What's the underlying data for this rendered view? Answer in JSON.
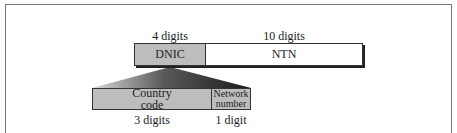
{
  "diagram": {
    "top_row": {
      "fields": [
        {
          "name": "DNIC",
          "size_label": "4 digits"
        },
        {
          "name": "NTN",
          "size_label": "10 digits"
        }
      ]
    },
    "dnic_breakdown": {
      "fields": [
        {
          "name": "Country code",
          "name_lines": [
            "Country",
            "code"
          ],
          "size_label": "3 digits"
        },
        {
          "name": "Network number",
          "name_lines": [
            "Network",
            "number"
          ],
          "size_label": "1 digit"
        }
      ]
    },
    "colors": {
      "shaded_field": "#bdbdbd",
      "plain_field": "#ffffff",
      "outline": "#333333"
    }
  }
}
